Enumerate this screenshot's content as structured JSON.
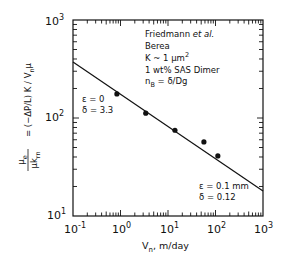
{
  "chart_data": {
    "type": "scatter",
    "title": "",
    "xlabel": "V_n, m/day",
    "ylabel": "μe / (μ k_rn) = (−ΔP/L) K / V_n μ",
    "xscale": "log",
    "yscale": "log",
    "xlim": [
      0.1,
      1000
    ],
    "ylim": [
      10,
      1000
    ],
    "x_ticks": [
      "10^-1",
      "10^0",
      "10^1",
      "10^2",
      "10^3"
    ],
    "y_ticks": [
      "10^1",
      "10^2",
      "10^3"
    ],
    "grid": false,
    "series": [
      {
        "name": "Data",
        "kind": "points",
        "x": [
          0.84,
          3.4,
          14,
          57,
          112
        ],
        "y": [
          176,
          112,
          75,
          57,
          41
        ]
      },
      {
        "name": "Model fit",
        "kind": "line",
        "x": [
          0.1,
          1000
        ],
        "y": [
          373,
          18
        ]
      }
    ],
    "annotations": [
      {
        "text": "Friedmann et al.",
        "italic_part": "et al."
      },
      {
        "text": "Berea"
      },
      {
        "text": "K ~ 1 μm²"
      },
      {
        "text": "1 wt% SAS Dimer"
      },
      {
        "text": "n_B = δ/Dg"
      },
      {
        "text": "ε = 0"
      },
      {
        "text": "δ = 3.3"
      },
      {
        "text": "ε = 0.1 mm"
      },
      {
        "text": "δ = 0.12"
      }
    ]
  },
  "labels": {
    "yt3": "10",
    "yt3e": "3",
    "yt2": "10",
    "yt2e": "2",
    "yt1": "10",
    "yt1e": "1",
    "xtm1": "10",
    "xtm1e": "-1",
    "xt0": "10",
    "xt0e": "0",
    "xt1": "10",
    "xt1e": "1",
    "xt2": "10",
    "xt2e": "2",
    "xt3": "10",
    "xt3e": "3",
    "xlabel_main": "V",
    "xlabel_sub": "n",
    "xlabel_rest": ", m/day",
    "ann_author": "Friedmann ",
    "ann_etal": "et al.",
    "ann_rock": "Berea",
    "ann_perm": "K ~ 1 μm",
    "ann_perm_sup": "2",
    "ann_surf": "1 wt% SAS Dimer",
    "ann_nb": "n",
    "ann_nb_sub": "B",
    "ann_nb_rest": " = δ/Dg",
    "ann_eps0": "ε = 0",
    "ann_del33": "δ = 3.3",
    "ann_eps01": "ε = 0.1 mm",
    "ann_del012": "δ = 0.12",
    "ylab_rhs": "= (−ΔP/L) K / V",
    "ylab_rhs_sub": "n",
    "ylab_rhs_mu": "μ",
    "ylab_num": "μ",
    "ylab_num_sub": "e",
    "ylab_den": "μk",
    "ylab_den_sub": "rn"
  }
}
